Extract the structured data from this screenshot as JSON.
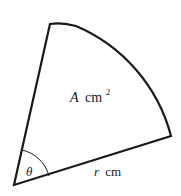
{
  "diagram": {
    "type": "circular-sector",
    "area_label": {
      "var": "A",
      "unit": "cm",
      "exp": "2"
    },
    "radius_label": {
      "var": "r",
      "unit": "cm"
    },
    "angle_label": "θ",
    "colors": {
      "stroke": "#1a1a1a",
      "background": "#ffffff"
    }
  }
}
